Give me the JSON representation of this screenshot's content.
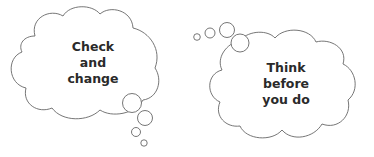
{
  "clouds": [
    {
      "name": "left-thought-cloud",
      "lines": [
        "Check",
        "and",
        "change"
      ],
      "tail_direction": "bottom-right"
    },
    {
      "name": "right-thought-cloud",
      "lines": [
        "Think",
        "before",
        "you do"
      ],
      "tail_direction": "top-left"
    }
  ],
  "colors": {
    "outline": "#555555",
    "text": "#2a2a2a",
    "background": "#ffffff"
  }
}
